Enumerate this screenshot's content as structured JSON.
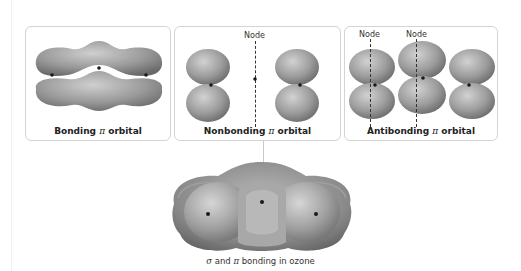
{
  "figure": {
    "panels": [
      {
        "id": "bonding",
        "caption_prefix": "Bonding ",
        "caption_symbol": "π",
        "caption_suffix": " orbital",
        "node_labels": []
      },
      {
        "id": "nonbonding",
        "caption_prefix": "Nonbonding ",
        "caption_symbol": "π",
        "caption_suffix": " orbital",
        "node_labels": [
          "Node"
        ]
      },
      {
        "id": "antibonding",
        "caption_prefix": "Antibonding ",
        "caption_symbol": "π",
        "caption_suffix": " orbital",
        "node_labels": [
          "Node",
          "Node"
        ]
      }
    ],
    "bottom_caption": {
      "sigma": "σ",
      "mid": " and ",
      "pi": "π",
      "suffix": " bonding in ozone"
    },
    "colors": {
      "lobe_light": "#c8c8c8",
      "lobe_dark": "#6e6e6e",
      "panel_border": "#d4d4d4",
      "nucleus": "#1a1a1a"
    }
  }
}
